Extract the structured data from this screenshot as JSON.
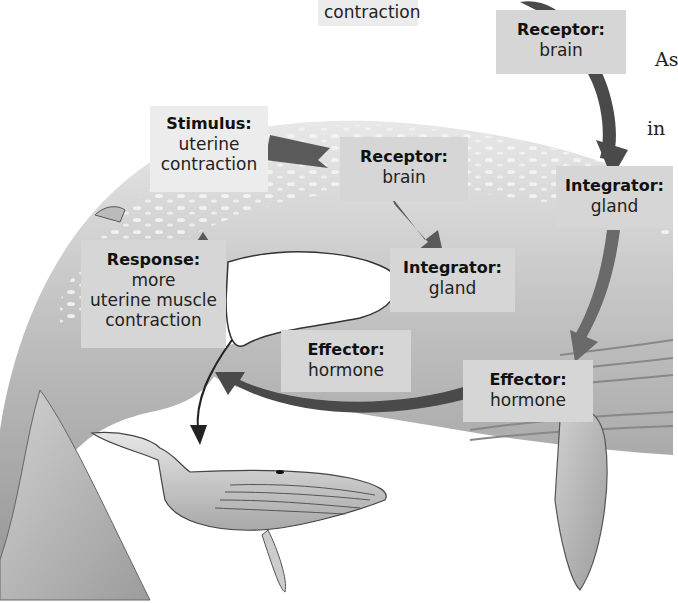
{
  "diagram": {
    "loop_inner": {
      "stimulus": {
        "heading": "Stimulus:",
        "lines": [
          "uterine",
          "contraction"
        ]
      },
      "receptor": {
        "heading": "Receptor:",
        "lines": [
          "brain"
        ]
      },
      "integrator": {
        "heading": "Integrator:",
        "lines": [
          "gland"
        ]
      },
      "effector": {
        "heading": "Effector:",
        "lines": [
          "hormone"
        ]
      },
      "response": {
        "heading": "Response:",
        "lines": [
          "more",
          "uterine muscle",
          "contraction"
        ]
      }
    },
    "loop_outer": {
      "top_partial": {
        "lines": [
          "contraction"
        ]
      },
      "receptor": {
        "heading": "Receptor:",
        "lines": [
          "brain"
        ]
      },
      "integrator": {
        "heading": "Integrator:",
        "lines": [
          "gland"
        ]
      },
      "effector": {
        "heading": "Effector:",
        "lines": [
          "hormone"
        ]
      }
    },
    "side_text": {
      "lines": [
        "As",
        "in",
        "f"
      ]
    },
    "colors": {
      "label_bg": "#d6d6d6",
      "label_bg_light": "#ececec",
      "arrow_dark": "#4a4a4a",
      "whale_body": "#b8b8b8",
      "background": "#ffffff"
    }
  }
}
